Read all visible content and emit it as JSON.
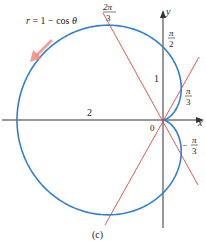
{
  "figure": {
    "caption": "(c)",
    "equation": "r = 1 − cos θ",
    "axes": {
      "x_label": "x",
      "y_label": "y",
      "origin_label": "0"
    },
    "tick_labels": {
      "x_neg": "2",
      "y_pos": "1"
    },
    "angle_labels": [
      {
        "num": "2π",
        "den": "3"
      },
      {
        "num": "π",
        "den": "2"
      },
      {
        "num": "π",
        "den": "3"
      },
      {
        "num": "π",
        "den": "3",
        "sign": "−"
      }
    ],
    "colors": {
      "curve": "#2f7fd0",
      "tangent": "#e0483c",
      "arrow": "#f08a80",
      "axis": "#333333"
    }
  },
  "chart_data": {
    "type": "polar",
    "title": "r = 1 − cos θ",
    "curve": "cardioid r = 1 − cos θ",
    "tangent_lines_at": [
      "2π/3",
      "π/3",
      "−π/3"
    ],
    "marked_points": [
      "θ = 2π/3",
      "θ = π/2 (r = 1)",
      "θ = π/3",
      "θ = −π/3"
    ],
    "x_tick": [
      -2
    ],
    "y_tick": [
      1
    ],
    "caption": "(c)"
  }
}
